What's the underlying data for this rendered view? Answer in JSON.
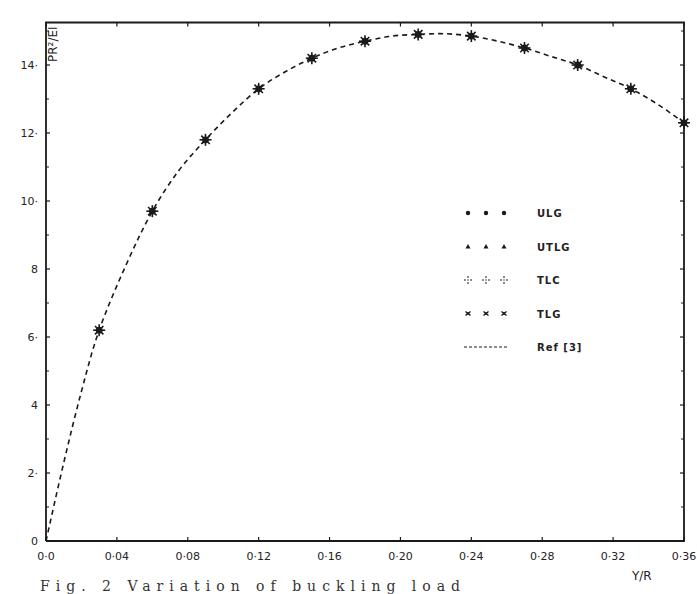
{
  "chart_data": {
    "type": "line",
    "title": "",
    "xlabel": "Y/R",
    "ylabel": "PR²/EI",
    "xlim": [
      0,
      0.36
    ],
    "ylim": [
      0,
      15.25
    ],
    "grid": false,
    "legend_position": "center-right",
    "x_ticks": [
      0,
      0.04,
      0.08,
      0.12,
      0.16,
      0.2,
      0.24,
      0.28,
      0.32,
      0.36
    ],
    "x_tick_labels": [
      "0·0",
      "0·04",
      "0·08",
      "0·12",
      "0·16",
      "0·20",
      "0·24",
      "0·28",
      "0·32",
      "0·36"
    ],
    "y_ticks": [
      0,
      2,
      4,
      6,
      8,
      10,
      12,
      14
    ],
    "y_tick_labels": [
      "0",
      "2·",
      "4",
      "6·",
      "8",
      "10·",
      "12·",
      "14·"
    ],
    "y_minor_ticks": [
      1,
      3,
      5,
      7,
      9,
      11,
      13,
      15
    ],
    "series": [
      {
        "name": "ULG",
        "marker": "dot",
        "x": [
          0.03,
          0.06,
          0.09,
          0.12,
          0.15,
          0.18,
          0.21,
          0.24,
          0.27,
          0.3,
          0.33,
          0.36
        ],
        "values": [
          6.2,
          9.7,
          11.8,
          13.3,
          14.2,
          14.7,
          14.9,
          14.85,
          14.5,
          14.0,
          13.3,
          12.3
        ]
      },
      {
        "name": "UTLG",
        "marker": "triangle",
        "x": [
          0.03,
          0.06,
          0.09,
          0.12,
          0.15,
          0.18,
          0.21,
          0.24,
          0.27,
          0.3,
          0.33,
          0.36
        ],
        "values": [
          6.2,
          9.7,
          11.8,
          13.3,
          14.2,
          14.7,
          14.9,
          14.85,
          14.5,
          14.0,
          13.3,
          12.3
        ]
      },
      {
        "name": "TLC",
        "marker": "dotted-cross",
        "x": [
          0.03,
          0.06,
          0.09,
          0.12,
          0.15,
          0.18,
          0.21,
          0.24,
          0.27,
          0.3,
          0.33,
          0.36
        ],
        "values": [
          6.2,
          9.7,
          11.8,
          13.3,
          14.2,
          14.7,
          14.9,
          14.85,
          14.5,
          14.0,
          13.3,
          12.3
        ]
      },
      {
        "name": "TLG",
        "marker": "x-cross",
        "x": [
          0.03,
          0.06,
          0.09,
          0.12,
          0.15,
          0.18,
          0.21,
          0.24,
          0.27,
          0.3,
          0.33,
          0.36
        ],
        "values": [
          6.2,
          9.7,
          11.8,
          13.3,
          14.2,
          14.7,
          14.9,
          14.85,
          14.5,
          14.0,
          13.3,
          12.3
        ]
      },
      {
        "name": "Ref [3]",
        "marker": "none",
        "line": "dashed",
        "x": [
          0.0,
          0.01,
          0.02,
          0.03,
          0.045,
          0.06,
          0.075,
          0.09,
          0.105,
          0.12,
          0.135,
          0.15,
          0.165,
          0.18,
          0.195,
          0.21,
          0.225,
          0.24,
          0.255,
          0.27,
          0.285,
          0.3,
          0.315,
          0.33,
          0.345,
          0.36
        ],
        "values": [
          0.0,
          2.3,
          4.4,
          6.2,
          8.1,
          9.7,
          10.9,
          11.8,
          12.6,
          13.3,
          13.8,
          14.2,
          14.5,
          14.7,
          14.85,
          14.9,
          14.92,
          14.85,
          14.7,
          14.5,
          14.25,
          14.0,
          13.65,
          13.3,
          12.85,
          12.3
        ]
      }
    ],
    "legend": [
      {
        "label": "ULG",
        "marker": "dot"
      },
      {
        "label": "UTLG",
        "marker": "triangle"
      },
      {
        "label": "TLC",
        "marker": "dotted-cross"
      },
      {
        "label": "TLG",
        "marker": "x-cross"
      },
      {
        "label": "Ref [3]",
        "marker": "dashed-line"
      }
    ],
    "annotations": []
  },
  "axes": {
    "ylabel": "PR²/EI",
    "xlabel": "Y/R"
  },
  "caption": {
    "text": "Fig. 2  Variation of buckling load"
  },
  "colors": {
    "ink": "#1a1a1a",
    "background": "#ffffff"
  }
}
